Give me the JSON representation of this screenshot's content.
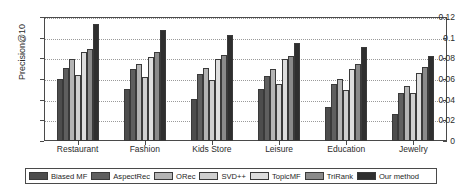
{
  "chart_data": {
    "type": "bar",
    "title": "",
    "xlabel": "",
    "ylabel": "Precision@10",
    "categories": [
      "Restaurant",
      "Fashion",
      "Kids Store",
      "Leisure",
      "Education",
      "Jewelry"
    ],
    "ylim": [
      0,
      0.12
    ],
    "yticks": [
      "0",
      "0.02",
      "0.04",
      "0.06",
      "0.08",
      "0.1",
      "0.12"
    ],
    "ytick_values": [
      0,
      0.02,
      0.04,
      0.06,
      0.08,
      0.1,
      0.12
    ],
    "grid": true,
    "legend_position": "below",
    "series": [
      {
        "name": "Biased MF",
        "color": "#4d4d4d",
        "values": [
          0.06,
          0.05,
          0.041,
          0.05,
          0.033,
          0.026
        ]
      },
      {
        "name": "AspectRec",
        "color": "#5f5f5f",
        "values": [
          0.071,
          0.07,
          0.065,
          0.063,
          0.055,
          0.046
        ]
      },
      {
        "name": "ORec",
        "color": "#b4b4b4",
        "values": [
          0.079,
          0.075,
          0.071,
          0.07,
          0.06,
          0.053
        ]
      },
      {
        "name": "SVD++",
        "color": "#cfcfcf",
        "values": [
          0.064,
          0.062,
          0.059,
          0.055,
          0.049,
          0.046
        ]
      },
      {
        "name": "TopicMF",
        "color": "#dedede",
        "values": [
          0.086,
          0.081,
          0.079,
          0.079,
          0.07,
          0.066
        ]
      },
      {
        "name": "TriRank",
        "color": "#8a8a8a",
        "values": [
          0.089,
          0.086,
          0.083,
          0.082,
          0.075,
          0.072
        ]
      },
      {
        "name": "Our method",
        "color": "#2f2f2f",
        "values": [
          0.113,
          0.107,
          0.103,
          0.095,
          0.091,
          0.082
        ]
      }
    ]
  },
  "legend": {
    "items": [
      {
        "label": "Biased MF"
      },
      {
        "label": "AspectRec"
      },
      {
        "label": "ORec"
      },
      {
        "label": "SVD++"
      },
      {
        "label": "TopicMF"
      },
      {
        "label": "TriRank"
      },
      {
        "label": "Our method"
      }
    ]
  }
}
